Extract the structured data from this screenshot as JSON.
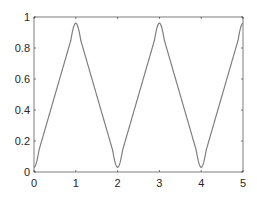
{
  "chart_data": {
    "type": "line",
    "title": "",
    "xlabel": "",
    "ylabel": "",
    "xlim": [
      0,
      5
    ],
    "ylim": [
      0,
      1
    ],
    "grid": false,
    "legend": null,
    "xticks": [
      0,
      1,
      2,
      3,
      4,
      5
    ],
    "xtick_labels": [
      "0",
      "1",
      "2",
      "3",
      "4",
      "5"
    ],
    "yticks": [
      0,
      0.2,
      0.4,
      0.6,
      0.8,
      1
    ],
    "ytick_labels": [
      "0",
      "0.2",
      "0.4",
      "0.6",
      "0.8",
      "1"
    ],
    "series": [
      {
        "name": "signal",
        "color": "#7f7f7f",
        "x": [
          0,
          0.25,
          0.5,
          0.75,
          1,
          1.25,
          1.5,
          1.75,
          2,
          2.25,
          2.5,
          2.75,
          3,
          3.25,
          3.5,
          3.75,
          4,
          4.25,
          4.5,
          4.75,
          5
        ],
        "values": [
          0.03,
          0.26,
          0.5,
          0.74,
          0.96,
          0.74,
          0.5,
          0.26,
          0.03,
          0.26,
          0.5,
          0.74,
          0.96,
          0.74,
          0.5,
          0.26,
          0.03,
          0.26,
          0.5,
          0.74,
          0.96
        ]
      }
    ]
  },
  "colors": {
    "axis": "#262626",
    "line": "#7f7f7f",
    "background": "#ffffff"
  }
}
